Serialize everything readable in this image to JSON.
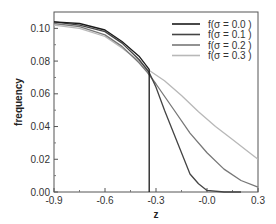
{
  "chart_data": {
    "type": "line",
    "title": "",
    "xlabel": "z",
    "ylabel": "frequency",
    "xlim": [
      -0.9,
      0.3
    ],
    "ylim": [
      0.0,
      0.11
    ],
    "grid": false,
    "legend_position": "upper right",
    "x_ticks": [
      "-0.9",
      "-0.6",
      "-0.3",
      "-0.0",
      "0.3"
    ],
    "y_ticks": [
      "0.00",
      "0.02",
      "0.04",
      "0.06",
      "0.08",
      "0.10"
    ],
    "series": [
      {
        "name": "f(σ = 0.0 )",
        "color": "#1a1a1a",
        "points": [
          [
            -0.9,
            0.104
          ],
          [
            -0.75,
            0.103
          ],
          [
            -0.6,
            0.099
          ],
          [
            -0.5,
            0.092
          ],
          [
            -0.4,
            0.083
          ],
          [
            -0.34,
            0.075
          ],
          [
            -0.34,
            0.0
          ]
        ]
      },
      {
        "name": "f(σ = 0.1 )",
        "color": "#444444",
        "points": [
          [
            -0.9,
            0.104
          ],
          [
            -0.75,
            0.102
          ],
          [
            -0.6,
            0.098
          ],
          [
            -0.5,
            0.091
          ],
          [
            -0.4,
            0.081
          ],
          [
            -0.34,
            0.073
          ],
          [
            -0.3,
            0.064
          ],
          [
            -0.25,
            0.05
          ],
          [
            -0.2,
            0.037
          ],
          [
            -0.15,
            0.024
          ],
          [
            -0.1,
            0.011
          ],
          [
            -0.05,
            0.005
          ],
          [
            0.0,
            0.001
          ],
          [
            0.1,
            0.0
          ],
          [
            0.2,
            0.0
          ]
        ]
      },
      {
        "name": "f(σ = 0.2 )",
        "color": "#777777",
        "points": [
          [
            -0.9,
            0.103
          ],
          [
            -0.75,
            0.101
          ],
          [
            -0.6,
            0.096
          ],
          [
            -0.5,
            0.089
          ],
          [
            -0.4,
            0.079
          ],
          [
            -0.35,
            0.073
          ],
          [
            -0.3,
            0.066
          ],
          [
            -0.2,
            0.051
          ],
          [
            -0.1,
            0.036
          ],
          [
            0.0,
            0.024
          ],
          [
            0.1,
            0.014
          ],
          [
            0.2,
            0.007
          ],
          [
            0.3,
            0.003
          ]
        ]
      },
      {
        "name": "f(σ = 0.3 )",
        "color": "#b8b8b8",
        "points": [
          [
            -0.9,
            0.102
          ],
          [
            -0.75,
            0.1
          ],
          [
            -0.6,
            0.095
          ],
          [
            -0.5,
            0.088
          ],
          [
            -0.4,
            0.08
          ],
          [
            -0.35,
            0.075
          ],
          [
            -0.25,
            0.068
          ],
          [
            -0.15,
            0.059
          ],
          [
            -0.05,
            0.049
          ],
          [
            0.05,
            0.04
          ],
          [
            0.15,
            0.032
          ],
          [
            0.25,
            0.024
          ],
          [
            0.3,
            0.02
          ]
        ]
      }
    ]
  }
}
